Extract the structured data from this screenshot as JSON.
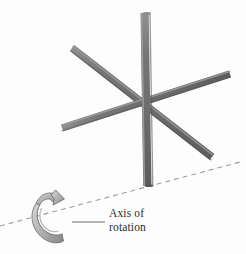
{
  "figure": {
    "kind": "physics-diagram",
    "title": "Axis of rotation",
    "background_color": "#fdfdfd",
    "width": 246,
    "height": 254
  },
  "annotation": {
    "line1": "Axis of",
    "line2": "rotation",
    "text_color": "#2b2b2b"
  },
  "axis": {
    "name": "axis-of-rotation",
    "style": "dashed",
    "color": "#9a9a9a",
    "x1": 0,
    "y1": 226,
    "x2": 240,
    "y2": 162,
    "dash_pattern": "5 4"
  },
  "leader": {
    "color": "#6b6b6b",
    "x1": 72,
    "y1": 222,
    "x2": 105,
    "y2": 222
  },
  "rotation_arrow": {
    "name": "rotation-coil-arrow",
    "fill": "#b9b9b9",
    "fill_dark": "#8f8f8f",
    "stroke": "#6f6f6f",
    "direction": "counterclockwise-about-axis"
  },
  "star": {
    "bar_color": "#6e6e6e",
    "bar_highlight": "#9c9c9c",
    "bar_shadow": "#565656",
    "center_x": 146,
    "center_y": 103,
    "bar_width": 8,
    "bars": [
      {
        "name": "bar-vertical",
        "x1": 144,
        "y1": 13,
        "x2": 147,
        "y2": 186,
        "z": 3
      },
      {
        "name": "bar-diagonal-descending",
        "x1": 72,
        "y1": 48,
        "x2": 212,
        "y2": 157,
        "z": 1
      },
      {
        "name": "bar-diagonal-ascending",
        "x1": 62,
        "y1": 128,
        "x2": 230,
        "y2": 74,
        "z": 2
      }
    ]
  }
}
